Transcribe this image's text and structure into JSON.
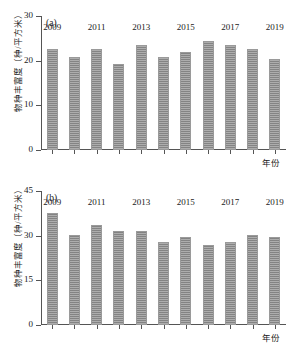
{
  "figure": {
    "panels": [
      {
        "id": "a",
        "label": "(a)",
        "ylabel": "物种丰富度（种/平方米）",
        "xlabel": "年份",
        "ymin": 0,
        "ymax": 30,
        "yticks": [
          "0",
          "10",
          "20",
          "30"
        ],
        "ytick_values": [
          0,
          10,
          20,
          30
        ],
        "xticks": [
          "2009",
          "2011",
          "2013",
          "2015",
          "2017",
          "2019"
        ],
        "xtick_years": [
          2009,
          2011,
          2013,
          2015,
          2017,
          2019
        ],
        "categories": [
          "2009",
          "2010",
          "2011",
          "2012",
          "2013",
          "2014",
          "2015",
          "2016",
          "2017",
          "2018",
          "2019"
        ],
        "values": [
          22.6,
          20.9,
          22.6,
          19.2,
          23.5,
          20.9,
          21.9,
          24.3,
          23.5,
          22.7,
          20.3
        ]
      },
      {
        "id": "b",
        "label": "(b)",
        "ylabel": "物种丰富度（种/平方米）",
        "xlabel": "年份",
        "ymin": 0,
        "ymax": 45,
        "yticks": [
          "0",
          "15",
          "30",
          "45"
        ],
        "ytick_values": [
          0,
          15,
          30,
          45
        ],
        "xticks": [
          "2009",
          "2011",
          "2013",
          "2015",
          "2017",
          "2019"
        ],
        "xtick_years": [
          2009,
          2011,
          2013,
          2015,
          2017,
          2019
        ],
        "categories": [
          "2009",
          "2010",
          "2011",
          "2012",
          "2013",
          "2014",
          "2015",
          "2016",
          "2017",
          "2018",
          "2019"
        ],
        "values": [
          37.6,
          30.2,
          33.7,
          31.6,
          31.7,
          27.9,
          29.4,
          26.8,
          27.9,
          30.3,
          29.5
        ]
      }
    ]
  },
  "chart_data": [
    {
      "type": "bar",
      "title": "(a)",
      "xlabel": "年份",
      "ylabel": "物种丰富度（种/平方米）",
      "categories": [
        "2009",
        "2010",
        "2011",
        "2012",
        "2013",
        "2014",
        "2015",
        "2016",
        "2017",
        "2018",
        "2019"
      ],
      "values": [
        22.6,
        20.9,
        22.6,
        19.2,
        23.5,
        20.9,
        21.9,
        24.3,
        23.5,
        22.7,
        20.3
      ],
      "ylim": [
        0,
        30
      ],
      "yticks": [
        0,
        10,
        20,
        30
      ],
      "xtick_labels": [
        "2009",
        "2011",
        "2013",
        "2015",
        "2017",
        "2019"
      ],
      "grid": false,
      "legend": "none",
      "bar_color": "#8a8a8a"
    },
    {
      "type": "bar",
      "title": "(b)",
      "xlabel": "年份",
      "ylabel": "物种丰富度（种/平方米）",
      "categories": [
        "2009",
        "2010",
        "2011",
        "2012",
        "2013",
        "2014",
        "2015",
        "2016",
        "2017",
        "2018",
        "2019"
      ],
      "values": [
        37.6,
        30.2,
        33.7,
        31.6,
        31.7,
        27.9,
        29.4,
        26.8,
        27.9,
        30.3,
        29.5
      ],
      "ylim": [
        0,
        45
      ],
      "yticks": [
        0,
        15,
        30,
        45
      ],
      "xtick_labels": [
        "2009",
        "2011",
        "2013",
        "2015",
        "2017",
        "2019"
      ],
      "grid": false,
      "legend": "none",
      "bar_color": "#8a8a8a"
    }
  ]
}
